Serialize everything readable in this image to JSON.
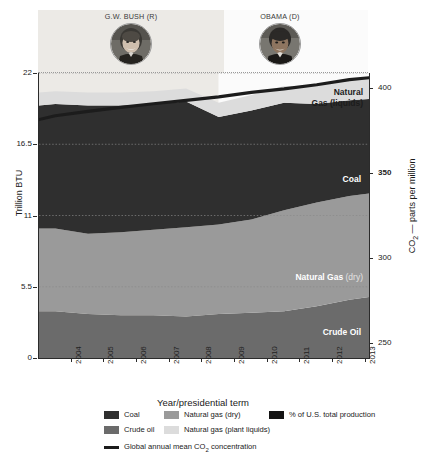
{
  "header": {
    "bush": {
      "name": "G.W. BUSH (R)",
      "portrait_icon": "bush-portrait-icon"
    },
    "obama": {
      "name": "OBAMA (D)",
      "portrait_icon": "obama-portrait-icon"
    }
  },
  "axes": {
    "left_title": "Trillion BTU",
    "right_title_main": "CO",
    "right_title_sub": "2",
    "right_title_rest": " — parts per million",
    "x_title": "Year/presidential term",
    "left_ticks": [
      "22",
      "16.5",
      "11",
      "5.5",
      "0"
    ],
    "right_ticks": [
      "400",
      "350",
      "300",
      "250"
    ],
    "x_ticks": [
      "2004",
      "2005",
      "2006",
      "2007",
      "2008",
      "2009",
      "2010",
      "2011",
      "2012",
      "2013"
    ]
  },
  "annotations": {
    "ngl_line1": "Natural",
    "ngl_line2": "Gas (liquids)",
    "coal": "Coal",
    "ngdry_bold": "Natural Gas",
    "ngdry_soft": " (dry)",
    "crude": "Crude Oil"
  },
  "legend": {
    "items": [
      {
        "label": "Coal",
        "color": "#2f2f2f",
        "type": "swatch",
        "name": "legend-coal"
      },
      {
        "label": "Natural gas (dry)",
        "color": "#9a9a9a",
        "type": "swatch",
        "name": "legend-natural-gas-dry"
      },
      {
        "label": "% of U.S. total production",
        "color": "#141414",
        "type": "swatch",
        "name": "legend-pct-us-total-production"
      },
      {
        "label": "Crude oil",
        "color": "#6b6b6b",
        "type": "swatch",
        "name": "legend-crude-oil"
      },
      {
        "label": "Natural gas (plant liquids)",
        "color": "#dcdcdc",
        "type": "swatch",
        "name": "legend-natural-gas-plant-liquids"
      }
    ],
    "line_item": {
      "label_pre": "Global annual mean CO",
      "label_sub": "2",
      "label_post": " concentration",
      "color": "#1c1c1c"
    }
  },
  "colors": {
    "coal": "#2f2f2f",
    "crude_oil": "#6b6b6b",
    "natural_gas_dry": "#9a9a9a",
    "natural_gas_liquids": "#dcdcdc",
    "co2_line": "#1c1c1c",
    "bush_band": "#eceae6",
    "obama_band": "#fbfbfb",
    "axis": "#2b2b2b",
    "gridline": "#8a8a8a"
  },
  "chart_data": {
    "type": "area",
    "title": "",
    "subtitle": "",
    "xlabel": "Year/presidential term",
    "ylabel": "Trillion BTU",
    "y2label": "CO2 — parts per million",
    "ylim": [
      0,
      22
    ],
    "y2lim": [
      250,
      400
    ],
    "yticks": [
      0,
      5.5,
      11,
      16.5,
      22
    ],
    "y2ticks": [
      250,
      300,
      350,
      400
    ],
    "grid": true,
    "legend_position": "bottom",
    "stacked": true,
    "x": [
      2003.5,
      2004,
      2005,
      2006,
      2007,
      2008,
      2009,
      2010,
      2011,
      2012,
      2013,
      2013.6
    ],
    "series": [
      {
        "name": "Crude oil",
        "color": "#6b6b6b",
        "values": [
          3.6,
          3.6,
          3.4,
          3.3,
          3.3,
          3.2,
          3.4,
          3.5,
          3.6,
          4.0,
          4.5,
          4.7
        ]
      },
      {
        "name": "Natural gas (dry)",
        "color": "#9a9a9a",
        "values": [
          6.4,
          6.4,
          6.2,
          6.4,
          6.6,
          6.9,
          6.9,
          7.2,
          7.8,
          8.0,
          8.0,
          8.0
        ]
      },
      {
        "name": "Coal",
        "color": "#2f2f2f",
        "values": [
          9.5,
          9.6,
          9.9,
          9.8,
          9.7,
          9.7,
          8.3,
          8.4,
          8.3,
          7.6,
          7.4,
          7.3
        ]
      },
      {
        "name": "Natural gas (plant liquids)",
        "color": "#dcdcdc",
        "values": [
          1.0,
          1.0,
          1.0,
          1.0,
          1.0,
          1.0,
          1.1,
          1.2,
          1.3,
          1.4,
          1.6,
          1.7
        ]
      }
    ],
    "line_series": {
      "name": "Global annual mean CO2 concentration",
      "color": "#1c1c1c",
      "axis": "right",
      "x": [
        2003.5,
        2004,
        2005,
        2006,
        2007,
        2008,
        2009,
        2010,
        2011,
        2012,
        2013,
        2013.6
      ],
      "values": [
        375.5,
        377.5,
        379.8,
        381.9,
        383.8,
        385.6,
        387.4,
        389.8,
        391.6,
        393.8,
        396.5,
        397.5
      ]
    },
    "presidential_bands": [
      {
        "label": "G.W. BUSH (R)",
        "x_start": 2003.5,
        "x_end": 2009.0,
        "color": "#eceae6"
      },
      {
        "label": "OBAMA (D)",
        "x_start": 2009.0,
        "x_end": 2013.6,
        "color": "#fbfbfb"
      }
    ],
    "annotations": [
      {
        "text": "Natural Gas (liquids)",
        "series": "Natural gas (plant liquids)"
      },
      {
        "text": "Coal",
        "series": "Coal"
      },
      {
        "text": "Natural Gas (dry)",
        "series": "Natural gas (dry)"
      },
      {
        "text": "Crude Oil",
        "series": "Crude oil"
      }
    ]
  }
}
